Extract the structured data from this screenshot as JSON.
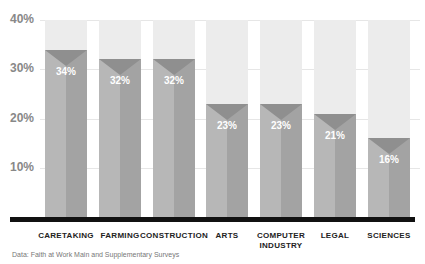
{
  "chart_data": {
    "type": "bar",
    "title": "",
    "xlabel": "",
    "ylabel": "",
    "ylim": [
      0,
      40
    ],
    "yticks": [
      "10%",
      "20%",
      "30%",
      "40%"
    ],
    "categories": [
      "CARETAKING",
      "FARMING",
      "CONSTRUCTION",
      "ARTS",
      "COMPUTER INDUSTRY",
      "LEGAL",
      "SCIENCES"
    ],
    "values": [
      34,
      32,
      32,
      23,
      23,
      21,
      16
    ],
    "value_labels": [
      "34%",
      "32%",
      "32%",
      "23%",
      "23%",
      "21%",
      "16%"
    ],
    "grid": true,
    "legend": null
  },
  "source": "Data: Faith at Work Main and Supplementary Surveys"
}
